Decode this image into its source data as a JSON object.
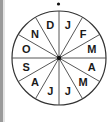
{
  "diagram": {
    "type": "circular-month-wheel",
    "segments": [
      {
        "label": "J"
      },
      {
        "label": "F"
      },
      {
        "label": "M"
      },
      {
        "label": "A"
      },
      {
        "label": "M"
      },
      {
        "label": "J"
      },
      {
        "label": "J"
      },
      {
        "label": "A"
      },
      {
        "label": "S"
      },
      {
        "label": "O"
      },
      {
        "label": "N"
      },
      {
        "label": "D"
      }
    ],
    "colors": {
      "stroke": "#333333",
      "fill": "#ffffff",
      "text": "#1a1a1a",
      "left_strip": "#9a9a9a"
    }
  }
}
